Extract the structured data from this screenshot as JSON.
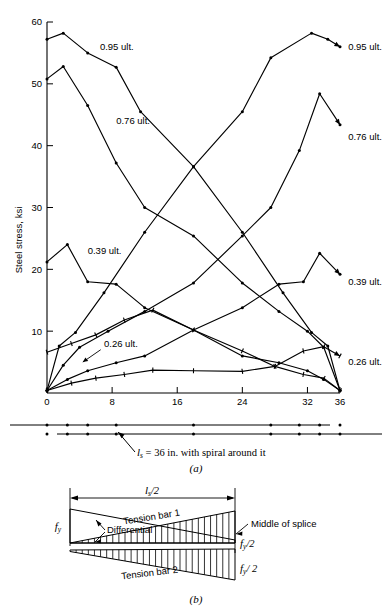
{
  "figure": {
    "panel_a_letter": "(a)",
    "panel_b_letter": "(b)",
    "specimen_note": "= 36 in. with spiral around it",
    "specimen_note_symbol": "l",
    "specimen_note_subscript": "s",
    "specimen_note_equals": "="
  },
  "chart_data": {
    "type": "line",
    "title": "",
    "xlabel": "",
    "ylabel": "Steel stress, ksi",
    "xlim": [
      0,
      36
    ],
    "ylim": [
      0,
      60
    ],
    "xticks": [
      0,
      8,
      16,
      24,
      32,
      36
    ],
    "xtick_labels": [
      "0",
      "8",
      "16",
      "24",
      "32",
      "36"
    ],
    "yticks": [
      10,
      20,
      30,
      40,
      50,
      60
    ],
    "ytick_labels": [
      "10",
      "20",
      "30",
      "40",
      "50",
      "60"
    ],
    "grid": false,
    "legend": "inline-annotations",
    "series": [
      {
        "name": "0.95 ult. descending",
        "label": "0.95 ult.",
        "label_side": "left",
        "marker": "dot",
        "x": [
          0,
          2,
          5,
          8.5,
          11.5,
          18,
          24,
          29,
          32.5,
          34.5,
          36
        ],
        "y": [
          57.2,
          58.2,
          55.0,
          52.7,
          45.5,
          36.6,
          26.0,
          16.2,
          9.8,
          7.6,
          0.4
        ]
      },
      {
        "name": "0.95 ult. ascending",
        "label": "0.95 ult.",
        "label_side": "right",
        "marker": "dot",
        "x": [
          0,
          1.5,
          3.5,
          7,
          12,
          18,
          24,
          27.5,
          32.5,
          34.5,
          36
        ],
        "y": [
          0.4,
          7.6,
          9.8,
          16.2,
          26.0,
          36.6,
          45.5,
          54.2,
          58.2,
          57.2,
          56.0
        ]
      },
      {
        "name": "0.76 ult. descending",
        "label": "0.76 ult.",
        "label_side": "left",
        "marker": "dot",
        "x": [
          0,
          2,
          5,
          8.5,
          12,
          18,
          24,
          28.5,
          32,
          34,
          36
        ],
        "y": [
          50.8,
          52.8,
          46.5,
          37.2,
          30.0,
          25.4,
          17.8,
          13.2,
          10.0,
          7.4,
          0.4
        ]
      },
      {
        "name": "0.76 ult. ascending",
        "label": "0.76 ult.",
        "label_side": "right",
        "marker": "dot",
        "x": [
          0,
          2,
          4,
          7.5,
          12,
          18,
          24,
          27.5,
          31,
          33.5,
          36
        ],
        "y": [
          0.4,
          4.5,
          7.4,
          10.0,
          13.2,
          17.8,
          25.4,
          30.0,
          39.2,
          48.4,
          43.4
        ]
      },
      {
        "name": "0.39 ult. descending",
        "label": "0.39 ult.",
        "label_side": "left",
        "marker": "dot",
        "x": [
          0,
          2.5,
          5,
          8.5,
          12,
          18,
          24,
          28.5,
          32,
          34,
          36
        ],
        "y": [
          21.2,
          24.0,
          18.0,
          17.6,
          13.8,
          10.2,
          6.0,
          4.9,
          3.6,
          2.2,
          0.4
        ]
      },
      {
        "name": "0.39 ult. ascending",
        "label": "0.39 ult.",
        "label_side": "right",
        "marker": "dot",
        "x": [
          0,
          2.5,
          5,
          8.5,
          12,
          18,
          24,
          28.5,
          31.5,
          33.5,
          36
        ],
        "y": [
          0.4,
          2.2,
          3.6,
          4.9,
          6.0,
          10.2,
          13.8,
          17.6,
          18.0,
          22.6,
          19.2
        ]
      },
      {
        "name": "0.26 ult. descending",
        "label": "0.26 ult.",
        "label_side": "left",
        "marker": "tick",
        "x": [
          0,
          3,
          6,
          9.5,
          13,
          18,
          24,
          28,
          31.5,
          34,
          36
        ],
        "y": [
          6.6,
          8.0,
          9.4,
          11.8,
          13.4,
          10.2,
          6.8,
          4.3,
          3.0,
          2.4,
          0.4
        ]
      },
      {
        "name": "0.26 ult. ascending",
        "label": "0.26 ult.",
        "label_side": "right",
        "marker": "tick",
        "x": [
          0,
          3,
          6,
          9.5,
          13,
          18,
          24,
          28,
          31.5,
          34,
          36
        ],
        "y": [
          0.4,
          1.6,
          2.4,
          3.0,
          3.7,
          3.6,
          3.5,
          4.3,
          6.8,
          7.5,
          6.0
        ]
      }
    ],
    "annotations": [
      {
        "text": "0.95 ult.",
        "x": 6.5,
        "y": 56.0,
        "align": "start"
      },
      {
        "text": "0.76 ult.",
        "x": 8.5,
        "y": 44.0,
        "align": "start"
      },
      {
        "text": "0.39 ult.",
        "x": 5.0,
        "y": 23.0,
        "align": "start"
      },
      {
        "text": "0.26 ult.",
        "x": 7.0,
        "y": 8.0,
        "align": "start"
      },
      {
        "text": "0.95 ult.",
        "x": 37.0,
        "y": 56.0,
        "align": "start"
      },
      {
        "text": "0.76 ult.",
        "x": 37.0,
        "y": 41.5,
        "align": "start"
      },
      {
        "text": "0.39 ult.",
        "x": 37.0,
        "y": 18.0,
        "align": "start"
      },
      {
        "text": "0.26 ult.",
        "x": 37.0,
        "y": 5.0,
        "align": "start"
      }
    ]
  },
  "diagram_b": {
    "dimension_label_symbol": "l",
    "dimension_label_subscript": "s",
    "dimension_label_divisor": "/2",
    "bar1_label": "Tension bar 1",
    "bar2_label": "Tension bar 2",
    "differential_label": "Differential",
    "middle_label": "Middle of splice",
    "fy_label_symbol": "f",
    "fy_label_subscript": "y",
    "fy_half_top": "/2",
    "fy_half_bottom": "/ 2"
  }
}
